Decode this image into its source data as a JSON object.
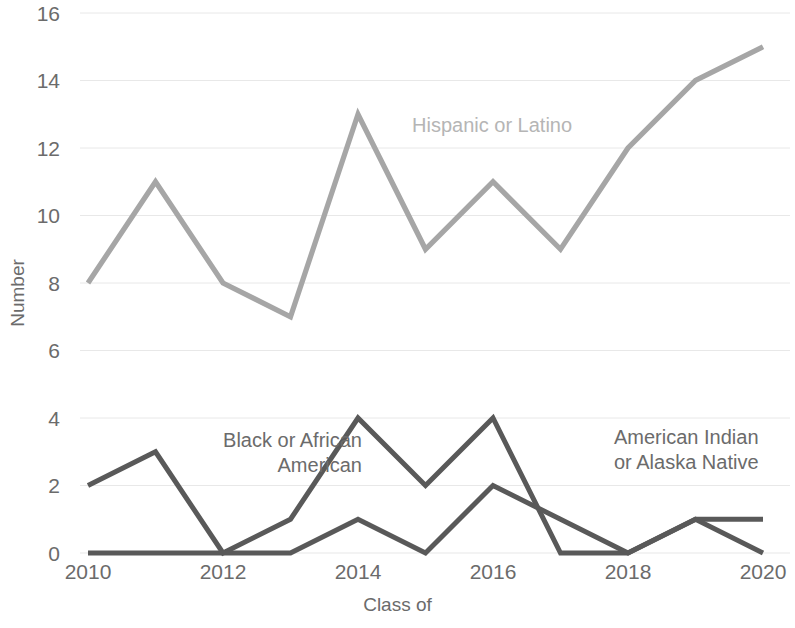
{
  "chart_data": {
    "type": "line",
    "title": "",
    "xlabel": "Class of",
    "ylabel": "Number",
    "x": [
      2010,
      2011,
      2012,
      2013,
      2014,
      2015,
      2016,
      2017,
      2018,
      2019,
      2020
    ],
    "xtick_labels": [
      "2010",
      "2012",
      "2014",
      "2016",
      "2018",
      "2020"
    ],
    "xtick_values": [
      2010,
      2012,
      2014,
      2016,
      2018,
      2020
    ],
    "ytick_labels": [
      "0",
      "2",
      "4",
      "6",
      "8",
      "10",
      "12",
      "14",
      "16"
    ],
    "ytick_values": [
      0,
      2,
      4,
      6,
      8,
      10,
      12,
      14,
      16
    ],
    "ylim": [
      0,
      16
    ],
    "xlim": [
      2010,
      2020
    ],
    "grid": "horizontal",
    "legend_position": "inline-annotations",
    "series": [
      {
        "name": "Hispanic or Latino",
        "color": "#a6a6a6",
        "values": [
          8,
          11,
          8,
          7,
          13,
          9,
          11,
          9,
          12,
          14,
          15
        ]
      },
      {
        "name": "Black or African American",
        "color": "#595959",
        "values": [
          2,
          3,
          0,
          1,
          4,
          2,
          4,
          0,
          0,
          1,
          0
        ]
      },
      {
        "name": "American Indian or Alaska Native",
        "color": "#595959",
        "values": [
          0,
          0,
          0,
          0,
          1,
          0,
          2,
          1,
          0,
          1,
          1
        ]
      }
    ],
    "annotations": [
      {
        "text": "Hispanic or Latino",
        "series": "Hispanic or Latino"
      },
      {
        "text": "Black or African\nAmerican",
        "series": "Black or African American"
      },
      {
        "text": "American Indian\nor Alaska Native",
        "series": "American Indian or Alaska Native"
      }
    ]
  },
  "axes": {
    "y_title": "Number",
    "x_title": "Class of"
  },
  "colors": {
    "light_series": "#a6a6a6",
    "dark_series": "#595959",
    "gridline": "#e8e8e8",
    "text": "#6b6b6b",
    "background": "#ffffff"
  }
}
